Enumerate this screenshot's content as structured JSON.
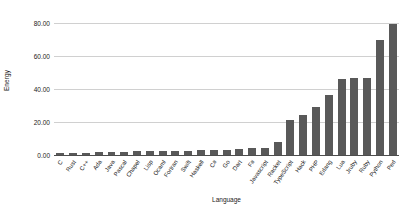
{
  "chart_data": {
    "type": "bar",
    "title": "",
    "xlabel": "Language",
    "ylabel": "Energy",
    "ylim": [
      0,
      85
    ],
    "yticks": [
      0,
      20,
      40,
      60,
      80
    ],
    "ytick_labels": [
      "0.00",
      "20.00",
      "40.00",
      "60.00",
      "80.00"
    ],
    "grid": true,
    "legend": false,
    "bar_color": "#595959",
    "gridline_color": "#d0d0d0",
    "axis_color": "#4d4d4d",
    "background_color": "#ffffff",
    "categories": [
      "C",
      "Rust",
      "C++",
      "Ada",
      "Java",
      "Pascal",
      "Chapel",
      "Lisp",
      "Ocaml",
      "Fortran",
      "Swift",
      "Haskell",
      "C#",
      "Go",
      "Dart",
      "F#",
      "Javascript",
      "Racket",
      "TypeScript",
      "Hack",
      "PHP",
      "Erlang",
      "Lua",
      "Jruby",
      "Ruby",
      "Python",
      "Perl"
    ],
    "values": [
      1.0,
      1.0,
      1.3,
      1.7,
      1.9,
      2.1,
      2.2,
      2.3,
      2.4,
      2.5,
      2.7,
      3.1,
      3.1,
      3.2,
      3.8,
      4.1,
      4.4,
      7.9,
      21.5,
      24.0,
      29.3,
      36.7,
      45.9,
      46.5,
      46.5,
      69.9,
      74.9
    ],
    "values_full": [
      1.0,
      1.0,
      1.3,
      1.7,
      1.9,
      2.1,
      2.2,
      2.3,
      2.4,
      2.5,
      2.7,
      3.1,
      3.1,
      3.2,
      3.8,
      4.1,
      4.4,
      7.9,
      21.5,
      24.0,
      29.3,
      36.7,
      45.9,
      46.5,
      46.5,
      69.9,
      79.6
    ]
  }
}
